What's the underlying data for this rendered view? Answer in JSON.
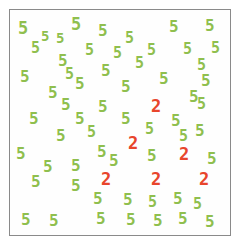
{
  "task": {
    "type": "visual-search",
    "target_character": "2",
    "distractor_character": "5",
    "target_count": 6,
    "distractor_count": 60,
    "total_items": 66
  },
  "colors": {
    "target_color": "#e8452c",
    "distractor_color": "#8fbf4e",
    "frame_border": "#8a8a8a",
    "background": "#fefefe",
    "page_background": "#ffffff"
  },
  "frame": {
    "x": 9,
    "y": 9,
    "width": 222,
    "height": 227,
    "border_width": 1
  },
  "items": [
    {
      "char": "5",
      "role": "distractor",
      "x": 17,
      "y": 19,
      "size": 17,
      "rot": 0
    },
    {
      "char": "5",
      "role": "distractor",
      "x": 40,
      "y": 28,
      "size": 14,
      "rot": 0
    },
    {
      "char": "5",
      "role": "distractor",
      "x": 70,
      "y": 15,
      "size": 17,
      "rot": 0
    },
    {
      "char": "5",
      "role": "distractor",
      "x": 97,
      "y": 22,
      "size": 16,
      "rot": 0
    },
    {
      "char": "5",
      "role": "distractor",
      "x": 124,
      "y": 30,
      "size": 15,
      "rot": 0
    },
    {
      "char": "5",
      "role": "distractor",
      "x": 168,
      "y": 18,
      "size": 16,
      "rot": 0
    },
    {
      "char": "5",
      "role": "distractor",
      "x": 204,
      "y": 17,
      "size": 16,
      "rot": 0
    },
    {
      "char": "5",
      "role": "distractor",
      "x": 84,
      "y": 42,
      "size": 15,
      "rot": 0
    },
    {
      "char": "5",
      "role": "distractor",
      "x": 146,
      "y": 42,
      "size": 15,
      "rot": 0
    },
    {
      "char": "5",
      "role": "distractor",
      "x": 182,
      "y": 41,
      "size": 15,
      "rot": 0
    },
    {
      "char": "5",
      "role": "distractor",
      "x": 57,
      "y": 52,
      "size": 16,
      "rot": 0
    },
    {
      "char": "5",
      "role": "distractor",
      "x": 19,
      "y": 68,
      "size": 16,
      "rot": 0
    },
    {
      "char": "5",
      "role": "distractor",
      "x": 100,
      "y": 62,
      "size": 16,
      "rot": 0
    },
    {
      "char": "5",
      "role": "distractor",
      "x": 74,
      "y": 75,
      "size": 16,
      "rot": 0
    },
    {
      "char": "5",
      "role": "distractor",
      "x": 158,
      "y": 70,
      "size": 16,
      "rot": 0
    },
    {
      "char": "5",
      "role": "distractor",
      "x": 200,
      "y": 72,
      "size": 16,
      "rot": 0
    },
    {
      "char": "5",
      "role": "distractor",
      "x": 47,
      "y": 84,
      "size": 16,
      "rot": 0
    },
    {
      "char": "5",
      "role": "distractor",
      "x": 120,
      "y": 78,
      "size": 16,
      "rot": 0
    },
    {
      "char": "5",
      "role": "distractor",
      "x": 188,
      "y": 88,
      "size": 16,
      "rot": 0
    },
    {
      "char": "5",
      "role": "distractor",
      "x": 97,
      "y": 98,
      "size": 16,
      "rot": 0
    },
    {
      "char": "5",
      "role": "distractor",
      "x": 28,
      "y": 110,
      "size": 16,
      "rot": 0
    },
    {
      "char": "5",
      "role": "distractor",
      "x": 74,
      "y": 110,
      "size": 16,
      "rot": 0
    },
    {
      "char": "5",
      "role": "distractor",
      "x": 120,
      "y": 110,
      "size": 16,
      "rot": 0
    },
    {
      "char": "2",
      "role": "target",
      "x": 150,
      "y": 97,
      "size": 17,
      "rot": 0
    },
    {
      "char": "5",
      "role": "distractor",
      "x": 170,
      "y": 112,
      "size": 16,
      "rot": 0
    },
    {
      "char": "5",
      "role": "distractor",
      "x": 194,
      "y": 122,
      "size": 16,
      "rot": 0
    },
    {
      "char": "5",
      "role": "distractor",
      "x": 55,
      "y": 127,
      "size": 16,
      "rot": 0
    },
    {
      "char": "2",
      "role": "target",
      "x": 127,
      "y": 134,
      "size": 17,
      "rot": 0
    },
    {
      "char": "5",
      "role": "distractor",
      "x": 15,
      "y": 145,
      "size": 16,
      "rot": 0
    },
    {
      "char": "5",
      "role": "distractor",
      "x": 96,
      "y": 143,
      "size": 16,
      "rot": 0
    },
    {
      "char": "5",
      "role": "distractor",
      "x": 146,
      "y": 147,
      "size": 16,
      "rot": 0
    },
    {
      "char": "2",
      "role": "target",
      "x": 178,
      "y": 145,
      "size": 17,
      "rot": 0
    },
    {
      "char": "5",
      "role": "distractor",
      "x": 206,
      "y": 150,
      "size": 16,
      "rot": 0
    },
    {
      "char": "5",
      "role": "distractor",
      "x": 42,
      "y": 158,
      "size": 16,
      "rot": 0
    },
    {
      "char": "5",
      "role": "distractor",
      "x": 70,
      "y": 157,
      "size": 16,
      "rot": 0
    },
    {
      "char": "5",
      "role": "distractor",
      "x": 30,
      "y": 173,
      "size": 16,
      "rot": 0
    },
    {
      "char": "5",
      "role": "distractor",
      "x": 70,
      "y": 177,
      "size": 16,
      "rot": 0
    },
    {
      "char": "2",
      "role": "target",
      "x": 100,
      "y": 170,
      "size": 17,
      "rot": 0
    },
    {
      "char": "2",
      "role": "target",
      "x": 150,
      "y": 170,
      "size": 17,
      "rot": 0
    },
    {
      "char": "2",
      "role": "target",
      "x": 198,
      "y": 170,
      "size": 17,
      "rot": 0
    },
    {
      "char": "5",
      "role": "distractor",
      "x": 92,
      "y": 190,
      "size": 16,
      "rot": 0
    },
    {
      "char": "5",
      "role": "distractor",
      "x": 122,
      "y": 191,
      "size": 16,
      "rot": 0
    },
    {
      "char": "5",
      "role": "distractor",
      "x": 147,
      "y": 194,
      "size": 15,
      "rot": 0
    },
    {
      "char": "5",
      "role": "distractor",
      "x": 172,
      "y": 190,
      "size": 16,
      "rot": 0
    },
    {
      "char": "5",
      "role": "distractor",
      "x": 20,
      "y": 211,
      "size": 16,
      "rot": 0
    },
    {
      "char": "5",
      "role": "distractor",
      "x": 48,
      "y": 212,
      "size": 16,
      "rot": 0
    },
    {
      "char": "5",
      "role": "distractor",
      "x": 95,
      "y": 210,
      "size": 16,
      "rot": 0
    },
    {
      "char": "5",
      "role": "distractor",
      "x": 125,
      "y": 211,
      "size": 16,
      "rot": 0
    },
    {
      "char": "5",
      "role": "distractor",
      "x": 152,
      "y": 212,
      "size": 16,
      "rot": 0
    },
    {
      "char": "5",
      "role": "distractor",
      "x": 177,
      "y": 210,
      "size": 16,
      "rot": 0
    },
    {
      "char": "5",
      "role": "distractor",
      "x": 204,
      "y": 213,
      "size": 16,
      "rot": 0
    },
    {
      "char": "5",
      "role": "distractor",
      "x": 30,
      "y": 40,
      "size": 15,
      "rot": 0
    },
    {
      "char": "5",
      "role": "distractor",
      "x": 55,
      "y": 30,
      "size": 14,
      "rot": 0
    },
    {
      "char": "5",
      "role": "distractor",
      "x": 112,
      "y": 45,
      "size": 15,
      "rot": 0
    },
    {
      "char": "5",
      "role": "distractor",
      "x": 134,
      "y": 55,
      "size": 15,
      "rot": 0
    },
    {
      "char": "5",
      "role": "distractor",
      "x": 196,
      "y": 57,
      "size": 15,
      "rot": 0
    },
    {
      "char": "5",
      "role": "distractor",
      "x": 144,
      "y": 90,
      "size": 0,
      "rot": 0
    },
    {
      "char": "5",
      "role": "distractor",
      "x": 60,
      "y": 96,
      "size": 16,
      "rot": 0
    },
    {
      "char": "5",
      "role": "distractor",
      "x": 144,
      "y": 121,
      "size": 15,
      "rot": 0
    },
    {
      "char": "5",
      "role": "distractor",
      "x": 86,
      "y": 124,
      "size": 15,
      "rot": 0
    },
    {
      "char": "5",
      "role": "distractor",
      "x": 196,
      "y": 96,
      "size": 15,
      "rot": 0
    },
    {
      "char": "5",
      "role": "distractor",
      "x": 178,
      "y": 128,
      "size": 15,
      "rot": 0
    },
    {
      "char": "5",
      "role": "distractor",
      "x": 108,
      "y": 152,
      "size": 16,
      "rot": 0
    },
    {
      "char": "5",
      "role": "distractor",
      "x": 192,
      "y": 196,
      "size": 15,
      "rot": 0
    },
    {
      "char": "5",
      "role": "distractor",
      "x": 64,
      "y": 66,
      "size": 15,
      "rot": 0
    },
    {
      "char": "5",
      "role": "distractor",
      "x": 210,
      "y": 40,
      "size": 15,
      "rot": 0
    }
  ]
}
